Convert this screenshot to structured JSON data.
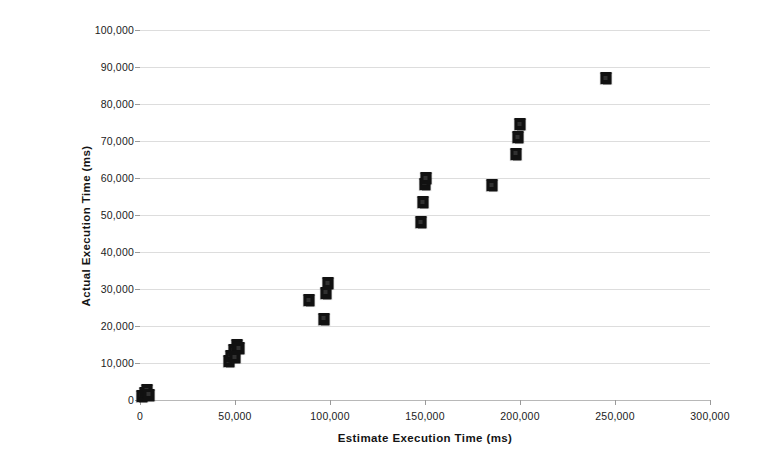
{
  "chart_data": {
    "type": "scatter",
    "title": "",
    "xlabel": "Estimate Execution Time (ms)",
    "ylabel": "Actual Execution Time (ms)",
    "xlim": [
      0,
      300000
    ],
    "ylim": [
      0,
      100000
    ],
    "xticks": [
      0,
      50000,
      100000,
      150000,
      200000,
      250000,
      300000
    ],
    "yticks": [
      0,
      10000,
      20000,
      30000,
      40000,
      50000,
      60000,
      70000,
      80000,
      90000,
      100000
    ],
    "xtick_labels": [
      "0",
      "50,000",
      "100,000",
      "150,000",
      "200,000",
      "250,000",
      "300,000"
    ],
    "ytick_labels": [
      "0",
      "10,000",
      "20,000",
      "30,000",
      "40,000",
      "50,000",
      "60,000",
      "70,000",
      "80,000",
      "90,000",
      "100,000"
    ],
    "grid": "horizontal",
    "legend": "none",
    "marker": "filled-square",
    "marker_color": "#111111",
    "series": [
      {
        "name": "Estimate vs Actual Execution Time",
        "points": [
          [
            1000,
            1200
          ],
          [
            2500,
            2000
          ],
          [
            3500,
            2600
          ],
          [
            4500,
            1400
          ],
          [
            47000,
            10500
          ],
          [
            48000,
            12000
          ],
          [
            49500,
            13500
          ],
          [
            51000,
            15000
          ],
          [
            52000,
            14000
          ],
          [
            50000,
            11500
          ],
          [
            89000,
            27000
          ],
          [
            97000,
            22000
          ],
          [
            98000,
            29000
          ],
          [
            99000,
            31500
          ],
          [
            148000,
            48000
          ],
          [
            149000,
            53500
          ],
          [
            150000,
            58500
          ],
          [
            150500,
            60000
          ],
          [
            185000,
            58000
          ],
          [
            198000,
            66500
          ],
          [
            199000,
            71000
          ],
          [
            200000,
            74500
          ],
          [
            245000,
            87000
          ]
        ]
      }
    ]
  }
}
